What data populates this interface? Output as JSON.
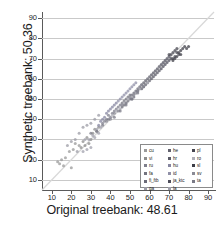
{
  "chart_data": {
    "type": "scatter",
    "title": "",
    "xlabel": "Original treebank: 48.61",
    "ylabel": "Synthetic treebank: 50.36",
    "xlim": [
      5,
      93
    ],
    "ylim": [
      5,
      93
    ],
    "xticks": [
      10,
      20,
      30,
      40,
      50,
      60,
      70,
      80,
      90
    ],
    "yticks": [
      10,
      20,
      30,
      40,
      50,
      60,
      70,
      80,
      90
    ],
    "grid": "horizontal",
    "reference_line": {
      "type": "identity",
      "label": "y = x",
      "color": "#d8d8d8"
    },
    "legend_position": "lower-right",
    "series": [
      {
        "name": "cu",
        "color": "#9a9a9a",
        "points": [
          [
            14,
            18
          ],
          [
            15,
            20
          ],
          [
            17,
            21
          ],
          [
            19,
            24
          ],
          [
            21,
            25
          ],
          [
            16,
            17
          ],
          [
            13,
            19
          ],
          [
            20,
            16
          ],
          [
            22,
            28
          ],
          [
            24,
            27
          ]
        ]
      },
      {
        "name": "vi",
        "color": "#8d8d8d",
        "points": [
          [
            26,
            29
          ],
          [
            28,
            31
          ],
          [
            30,
            30
          ],
          [
            27,
            27
          ],
          [
            31,
            33
          ],
          [
            29,
            28
          ],
          [
            25,
            26
          ],
          [
            32,
            35
          ],
          [
            33,
            34
          ],
          [
            34,
            36
          ]
        ]
      },
      {
        "name": "ru",
        "color": "#7f7f8c",
        "points": [
          [
            36,
            38
          ],
          [
            38,
            40
          ],
          [
            40,
            41
          ],
          [
            37,
            39
          ],
          [
            39,
            42
          ],
          [
            41,
            43
          ],
          [
            42,
            44
          ],
          [
            43,
            45
          ],
          [
            44,
            46
          ],
          [
            45,
            47
          ]
        ]
      },
      {
        "name": "fa",
        "color": "#74747f",
        "points": [
          [
            46,
            48
          ],
          [
            47,
            49
          ],
          [
            48,
            50
          ],
          [
            49,
            51
          ],
          [
            50,
            52
          ],
          [
            46,
            46
          ],
          [
            47,
            47
          ],
          [
            48,
            48
          ],
          [
            49,
            49
          ],
          [
            50,
            50
          ]
        ]
      },
      {
        "name": "fi_ftb",
        "color": "#6b6b78",
        "points": [
          [
            51,
            52
          ],
          [
            52,
            53
          ],
          [
            53,
            54
          ],
          [
            54,
            55
          ],
          [
            55,
            56
          ],
          [
            51,
            50
          ],
          [
            52,
            51
          ],
          [
            53,
            53
          ],
          [
            54,
            54
          ],
          [
            55,
            55
          ]
        ]
      },
      {
        "name": "ga",
        "color": "#9c9ca6",
        "points": [
          [
            22,
            30
          ],
          [
            24,
            33
          ],
          [
            26,
            36
          ],
          [
            28,
            37
          ],
          [
            30,
            38
          ],
          [
            32,
            40
          ],
          [
            34,
            42
          ],
          [
            20,
            29
          ],
          [
            18,
            27
          ],
          [
            23,
            24
          ]
        ]
      },
      {
        "name": "he",
        "color": "#62626e",
        "points": [
          [
            56,
            57
          ],
          [
            57,
            58
          ],
          [
            58,
            59
          ],
          [
            59,
            60
          ],
          [
            60,
            61
          ],
          [
            56,
            55
          ],
          [
            57,
            56
          ],
          [
            58,
            57
          ],
          [
            59,
            58
          ],
          [
            60,
            59
          ]
        ]
      },
      {
        "name": "hr",
        "color": "#5a5a66",
        "points": [
          [
            61,
            62
          ],
          [
            62,
            63
          ],
          [
            63,
            64
          ],
          [
            64,
            65
          ],
          [
            65,
            66
          ],
          [
            61,
            60
          ],
          [
            62,
            61
          ],
          [
            63,
            62
          ],
          [
            64,
            63
          ],
          [
            65,
            64
          ]
        ]
      },
      {
        "name": "hu",
        "color": "#8686a0",
        "points": [
          [
            34,
            37
          ],
          [
            35,
            39
          ],
          [
            36,
            40
          ],
          [
            37,
            41
          ],
          [
            38,
            43
          ],
          [
            39,
            44
          ],
          [
            40,
            45
          ],
          [
            41,
            46
          ],
          [
            42,
            47
          ],
          [
            43,
            48
          ]
        ]
      },
      {
        "name": "id",
        "color": "#9090a8",
        "points": [
          [
            44,
            49
          ],
          [
            45,
            50
          ],
          [
            46,
            51
          ],
          [
            47,
            52
          ],
          [
            48,
            53
          ],
          [
            49,
            54
          ],
          [
            50,
            55
          ],
          [
            51,
            56
          ],
          [
            52,
            57
          ],
          [
            53,
            58
          ]
        ]
      },
      {
        "name": "ja_ktc",
        "color": "#4f4f5c",
        "points": [
          [
            66,
            67
          ],
          [
            67,
            68
          ],
          [
            68,
            69
          ],
          [
            69,
            70
          ],
          [
            70,
            71
          ],
          [
            66,
            65
          ],
          [
            67,
            66
          ],
          [
            68,
            67
          ],
          [
            69,
            68
          ],
          [
            70,
            69
          ]
        ]
      },
      {
        "name": "la",
        "color": "#a0a0ac",
        "points": [
          [
            29,
            30
          ],
          [
            31,
            32
          ],
          [
            33,
            35
          ],
          [
            35,
            36
          ],
          [
            30,
            26
          ],
          [
            28,
            25
          ],
          [
            26,
            24
          ],
          [
            27,
            30
          ],
          [
            32,
            31
          ],
          [
            34,
            33
          ]
        ]
      },
      {
        "name": "pl",
        "color": "#45454f",
        "points": [
          [
            71,
            72
          ],
          [
            72,
            73
          ],
          [
            73,
            74
          ],
          [
            74,
            75
          ],
          [
            75,
            72
          ],
          [
            72,
            70
          ],
          [
            73,
            71
          ],
          [
            74,
            73
          ],
          [
            70,
            72
          ],
          [
            71,
            70
          ]
        ]
      },
      {
        "name": "ro",
        "color": "#b0b0b8",
        "points": [
          [
            41,
            42
          ],
          [
            43,
            44
          ],
          [
            45,
            45
          ],
          [
            47,
            48
          ],
          [
            49,
            50
          ],
          [
            51,
            51
          ],
          [
            53,
            53
          ],
          [
            55,
            55
          ],
          [
            57,
            56
          ],
          [
            59,
            58
          ]
        ]
      },
      {
        "name": "sl",
        "color": "#3c3c46",
        "points": [
          [
            76,
            74
          ],
          [
            78,
            76
          ],
          [
            80,
            76
          ],
          [
            77,
            75
          ],
          [
            79,
            75
          ],
          [
            75,
            73
          ],
          [
            76,
            72
          ],
          [
            74,
            71
          ],
          [
            73,
            70
          ],
          [
            72,
            69
          ]
        ]
      },
      {
        "name": "sv",
        "color": "#8a8a94",
        "points": [
          [
            38,
            39
          ],
          [
            40,
            40
          ],
          [
            42,
            43
          ],
          [
            44,
            44
          ],
          [
            46,
            47
          ],
          [
            48,
            48
          ],
          [
            50,
            51
          ],
          [
            52,
            52
          ],
          [
            54,
            54
          ],
          [
            56,
            57
          ]
        ]
      },
      {
        "name": "ta",
        "color": "#7a7a86",
        "points": [
          [
            30,
            33
          ],
          [
            33,
            34
          ],
          [
            36,
            37
          ],
          [
            39,
            40
          ],
          [
            42,
            41
          ],
          [
            45,
            44
          ],
          [
            48,
            47
          ],
          [
            51,
            50
          ],
          [
            54,
            53
          ],
          [
            57,
            56
          ]
        ]
      }
    ],
    "legend_columns": [
      [
        "cu",
        "vi",
        "ru",
        "fa",
        "fi_ftb",
        "ga"
      ],
      [
        "he",
        "hr",
        "hu",
        "id",
        "ja_ktc",
        "la"
      ],
      [
        "pl",
        "ro",
        "sl",
        "sv",
        "ta"
      ]
    ]
  }
}
